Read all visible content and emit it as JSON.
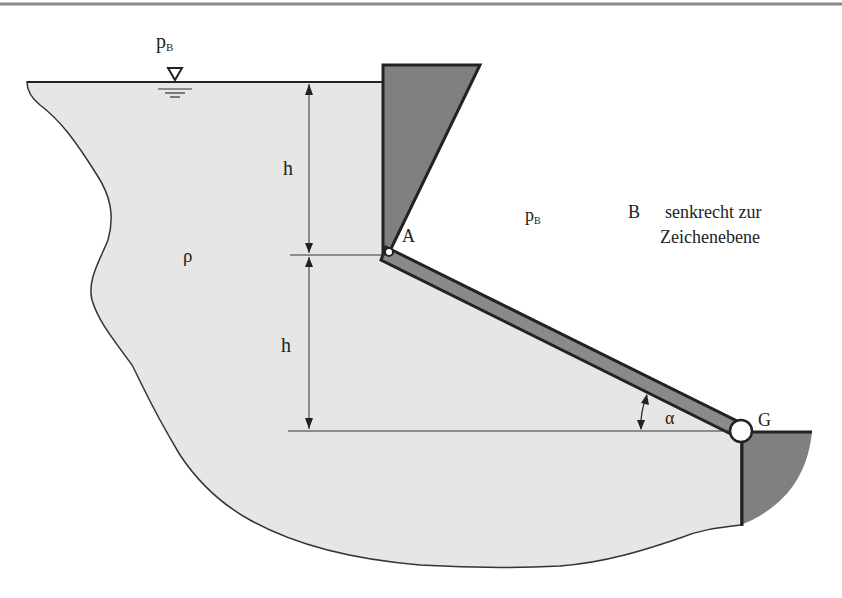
{
  "diagram": {
    "type": "hydrostatics-gate",
    "labels": {
      "surface_pressure": "p",
      "surface_pressure_sub": "B",
      "gate_pressure": "p",
      "gate_pressure_sub": "B",
      "density": "ρ",
      "height_upper": "h",
      "height_lower": "h",
      "hinge_a": "A",
      "hinge_g": "G",
      "angle": "α",
      "width_symbol": "B",
      "width_note_line1": "senkrecht zur",
      "width_note_line2": "Zeichenebene"
    },
    "colors": {
      "fluid": "#e6e6e6",
      "wall": "#808080",
      "gate": "#8a8a8a",
      "stroke": "#222222",
      "top_rule": "#888888"
    },
    "symbols": {
      "water_level": "inverted-triangle"
    }
  }
}
